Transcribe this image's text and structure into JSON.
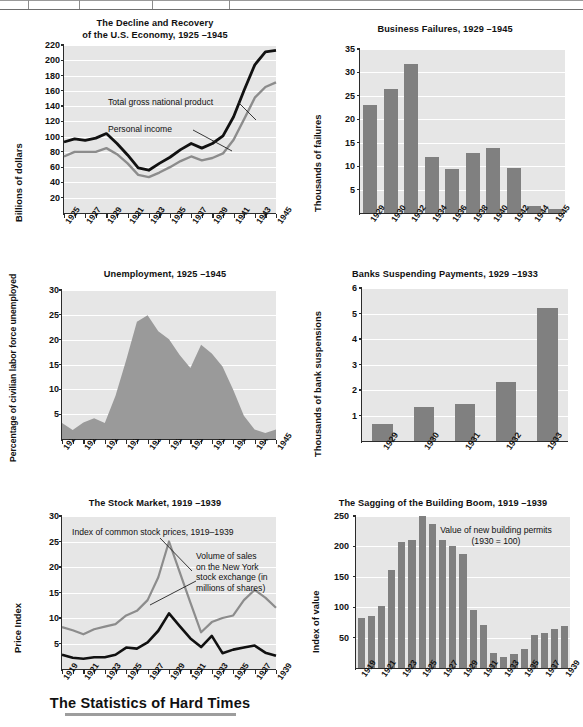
{
  "page": {
    "footer_title": "The Statistics of Hard Times",
    "colors": {
      "plot_background": "#e6e6e6",
      "gridline": "#ffffff",
      "bar": "#808080",
      "dark_series": "#111111",
      "light_series": "#8c8c8c",
      "axis": "#2b2b2b",
      "page_background": "#ffffff"
    }
  },
  "chart_data": [
    {
      "id": "gnp",
      "type": "line",
      "title": "The Decline and Recovery\nof the U.S. Economy, 1925 –1945",
      "title_line1": "The Decline and Recovery",
      "title_line2": "of the U.S. Economy, 1925 –1945",
      "xlabel": "",
      "ylabel": "Billions of dollars",
      "ylim": [
        0,
        220
      ],
      "yticks": [
        20,
        40,
        60,
        80,
        100,
        120,
        140,
        160,
        180,
        200,
        220
      ],
      "x": [
        1925,
        1926,
        1927,
        1928,
        1929,
        1930,
        1931,
        1932,
        1933,
        1934,
        1935,
        1936,
        1937,
        1938,
        1939,
        1940,
        1941,
        1942,
        1943,
        1944,
        1945
      ],
      "xticklabels": [
        "1925",
        "1927",
        "1929",
        "1931",
        "1933",
        "1935",
        "1937",
        "1939",
        "1941",
        "1943",
        "1945"
      ],
      "grid": true,
      "legend_position": "inline-annotations",
      "series": [
        {
          "name": "Total gross national product",
          "color": "#111111",
          "values": [
            93,
            97,
            95,
            98,
            104,
            91,
            76,
            59,
            56,
            65,
            73,
            83,
            91,
            85,
            91,
            101,
            126,
            161,
            194,
            211,
            213
          ]
        },
        {
          "name": "Personal income",
          "color": "#8c8c8c",
          "values": [
            74,
            80,
            80,
            80,
            85,
            77,
            65,
            50,
            47,
            53,
            60,
            68,
            74,
            69,
            72,
            78,
            96,
            123,
            151,
            165,
            171
          ]
        }
      ],
      "annotations": [
        {
          "text": "Total gross national product",
          "anchor_year": 1942,
          "anchor_value": 150
        },
        {
          "text": "Personal income",
          "anchor_year": 1941,
          "anchor_value": 96
        }
      ]
    },
    {
      "id": "business-failures",
      "type": "bar",
      "title": "Business Failures, 1929 –1945",
      "xlabel": "",
      "ylabel": "Thousands of failures",
      "ylim": [
        0,
        35
      ],
      "yticks": [
        5,
        10,
        15,
        20,
        25,
        30,
        35
      ],
      "categories": [
        "1929",
        "1930",
        "1932",
        "1934",
        "1936",
        "1938",
        "1940",
        "1942",
        "1944",
        "1945"
      ],
      "values": [
        23.1,
        26.4,
        31.8,
        12.0,
        9.4,
        12.8,
        13.8,
        9.5,
        1.5,
        0.8
      ],
      "grid": true
    },
    {
      "id": "unemployment",
      "type": "area",
      "title": "Unemployment, 1925 –1945",
      "xlabel": "",
      "ylabel": "Percentage of civilian labor force unemployed",
      "ylim": [
        0,
        30
      ],
      "yticks": [
        5,
        10,
        15,
        20,
        25,
        30
      ],
      "x": [
        1925,
        1926,
        1927,
        1928,
        1929,
        1930,
        1931,
        1932,
        1933,
        1934,
        1935,
        1936,
        1937,
        1938,
        1939,
        1940,
        1941,
        1942,
        1943,
        1944,
        1945
      ],
      "xticklabels": [
        "1925",
        "1927",
        "1929",
        "1931",
        "1933",
        "1935",
        "1937",
        "1939",
        "1941",
        "1943",
        "1945"
      ],
      "values": [
        3.2,
        1.8,
        3.3,
        4.2,
        3.2,
        8.7,
        15.9,
        23.6,
        24.9,
        21.7,
        20.1,
        16.9,
        14.3,
        19.0,
        17.2,
        14.6,
        9.9,
        4.7,
        1.9,
        1.2,
        1.9
      ],
      "grid": true,
      "fill_color": "#9a9a9a"
    },
    {
      "id": "bank-suspensions",
      "type": "bar",
      "title": "Banks Suspending Payments, 1929 –1933",
      "xlabel": "",
      "ylabel": "Thousands of bank suspensions",
      "ylim": [
        0,
        6
      ],
      "yticks": [
        1,
        2,
        3,
        4,
        5,
        6
      ],
      "categories": [
        "1929",
        "1930",
        "1931",
        "1932",
        "1933"
      ],
      "values": [
        0.66,
        1.35,
        1.45,
        2.3,
        5.2
      ],
      "grid": true
    },
    {
      "id": "stock-market",
      "type": "line",
      "title": "The Stock Market, 1919 –1939",
      "xlabel": "",
      "ylabel": "Price Index",
      "ylim": [
        0,
        30
      ],
      "yticks": [
        5,
        10,
        15,
        20,
        25,
        30
      ],
      "x": [
        1919,
        1920,
        1921,
        1922,
        1923,
        1924,
        1925,
        1926,
        1927,
        1928,
        1929,
        1930,
        1931,
        1932,
        1933,
        1934,
        1935,
        1936,
        1937,
        1938,
        1939
      ],
      "xticklabels": [
        "1919",
        "1921",
        "1923",
        "1925",
        "1927",
        "1929",
        "1931",
        "1933",
        "1935",
        "1937",
        "1939"
      ],
      "grid": true,
      "series": [
        {
          "name": "Index of common stock prices, 1919–1939",
          "color": "#8c8c8c",
          "values": [
            8.2,
            7.6,
            6.8,
            7.8,
            8.3,
            8.8,
            10.5,
            11.4,
            13.5,
            18.0,
            25.0,
            19.0,
            13.0,
            7.2,
            9.2,
            10.0,
            10.5,
            13.5,
            15.5,
            14.0,
            12.0
          ]
        },
        {
          "name": "Volume of sales on the New York stock exchange (in millions of shares)",
          "color": "#111111",
          "values": [
            2.8,
            2.2,
            2.0,
            2.3,
            2.3,
            2.8,
            4.2,
            4.0,
            5.2,
            7.5,
            10.9,
            8.4,
            6.0,
            4.3,
            6.5,
            3.1,
            3.8,
            4.2,
            4.6,
            3.2,
            2.6
          ]
        }
      ],
      "annotations": [
        {
          "text": "Index of common stock prices, 1919–1939"
        },
        {
          "text_lines": [
            "Volume of sales",
            "on the New York",
            "stock exchange (in",
            "millions of shares)"
          ]
        }
      ]
    },
    {
      "id": "building-boom",
      "type": "bar",
      "title": "The Sagging of the Building Boom, 1919 –1939",
      "xlabel": "",
      "ylabel": "Index of value",
      "ylim": [
        0,
        250
      ],
      "yticks": [
        50,
        100,
        150,
        200,
        250
      ],
      "categories": [
        "1919",
        "1920",
        "1921",
        "1922",
        "1923",
        "1924",
        "1925",
        "1926",
        "1927",
        "1928",
        "1929",
        "1930",
        "1931",
        "1932",
        "1933",
        "1934",
        "1935",
        "1936",
        "1937",
        "1938",
        "1939"
      ],
      "xticklabels": [
        "1919",
        "1921",
        "1923",
        "1925",
        "1927",
        "1929",
        "1931",
        "1933",
        "1935",
        "1937",
        "1939"
      ],
      "values": [
        82,
        85,
        102,
        161,
        208,
        210,
        250,
        237,
        210,
        200,
        187,
        96,
        71,
        24,
        18,
        23,
        32,
        54,
        57,
        64,
        69
      ],
      "grid": true,
      "annotation_lines": [
        "Value of new building permits",
        "(1930 = 100)"
      ]
    }
  ]
}
